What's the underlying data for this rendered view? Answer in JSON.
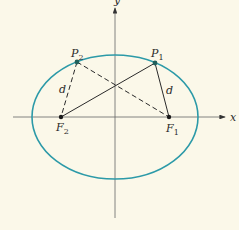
{
  "diagram": {
    "type": "ellipse-foci",
    "colors": {
      "background": "#fbf8e9",
      "ellipse": "#2c9aa8",
      "axes": "#555555",
      "lines": "#2a2a2a",
      "points": "#1f5f5a"
    },
    "axes": {
      "x_label": "x",
      "y_label": "y"
    },
    "points": {
      "P1": {
        "label": "P",
        "sub": "1"
      },
      "P2": {
        "label": "P",
        "sub": "2"
      },
      "F1": {
        "label": "F",
        "sub": "1"
      },
      "F2": {
        "label": "F",
        "sub": "2"
      }
    },
    "segments": {
      "d_left": "d",
      "d_right": "d"
    }
  }
}
